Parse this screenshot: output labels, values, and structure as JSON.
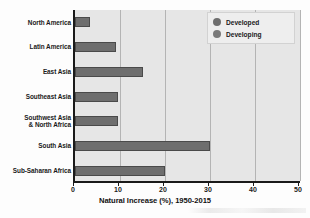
{
  "chart_data": {
    "type": "bar",
    "orientation": "horizontal",
    "title": "",
    "xlabel": "Natural Increase (%), 1950-2015",
    "ylabel": "",
    "xlim": [
      0,
      50
    ],
    "xticks": [
      0,
      10,
      20,
      30,
      40,
      50
    ],
    "xtick_labels": [
      "0",
      "10",
      "20",
      "30",
      "40",
      "50"
    ],
    "grid": true,
    "grid_axis": "x",
    "legend_position": "top-right",
    "categories": [
      "North America",
      "Latin America",
      "East Asia",
      "Southeast Asia",
      "Southwest Asia\n& North Africa",
      "South Asia",
      "Sub-Saharan Africa"
    ],
    "category_lines": [
      [
        "North America"
      ],
      [
        "Latin America"
      ],
      [
        "East Asia"
      ],
      [
        "Southeast Asia"
      ],
      [
        "Southwest Asia",
        "& North Africa"
      ],
      [
        "South Asia"
      ],
      [
        "Sub-Saharan Africa"
      ]
    ],
    "values": [
      3.3,
      9.2,
      15.0,
      9.5,
      9.5,
      30.0,
      20.0
    ],
    "series": [
      {
        "name": "Developing",
        "color": "#6e6e6e",
        "categories": [
          "North America",
          "Latin America",
          "East Asia",
          "Southeast Asia",
          "Southwest Asia & North Africa",
          "South Asia",
          "Sub-Saharan Africa"
        ],
        "values": [
          3.3,
          9.2,
          15.0,
          9.5,
          9.5,
          30.0,
          20.0
        ]
      }
    ],
    "legend_entries": [
      {
        "label": "Developed",
        "color": "#6e6e6e"
      },
      {
        "label": "Developing",
        "color": "#7a7a7a"
      }
    ]
  },
  "colors": {
    "plot_background": "#e6e6e6",
    "axis": "#1a1a1a",
    "gridline": "#b4b4b4",
    "bar_fill": "#6e6e6e",
    "bar_stroke": "#4a4a4a",
    "legend_background": "#eeeeee",
    "legend_border": "#d2d2d2",
    "text": "#1a1a1a"
  }
}
